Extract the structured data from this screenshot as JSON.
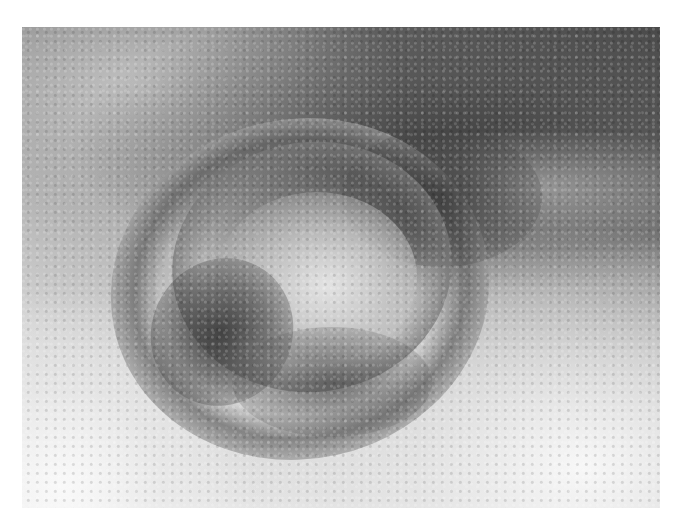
{
  "figure": {
    "type": "grayscale clinical photograph",
    "caption_fragment": "",
    "palette": {
      "page_background": "#ffffff",
      "dark_tone": "#3c3c3c",
      "mid_tone": "#8c8c8c",
      "light_tone": "#f0f0f0"
    },
    "bounds": {
      "left": 22,
      "top": 27,
      "width": 638,
      "height": 481
    }
  }
}
